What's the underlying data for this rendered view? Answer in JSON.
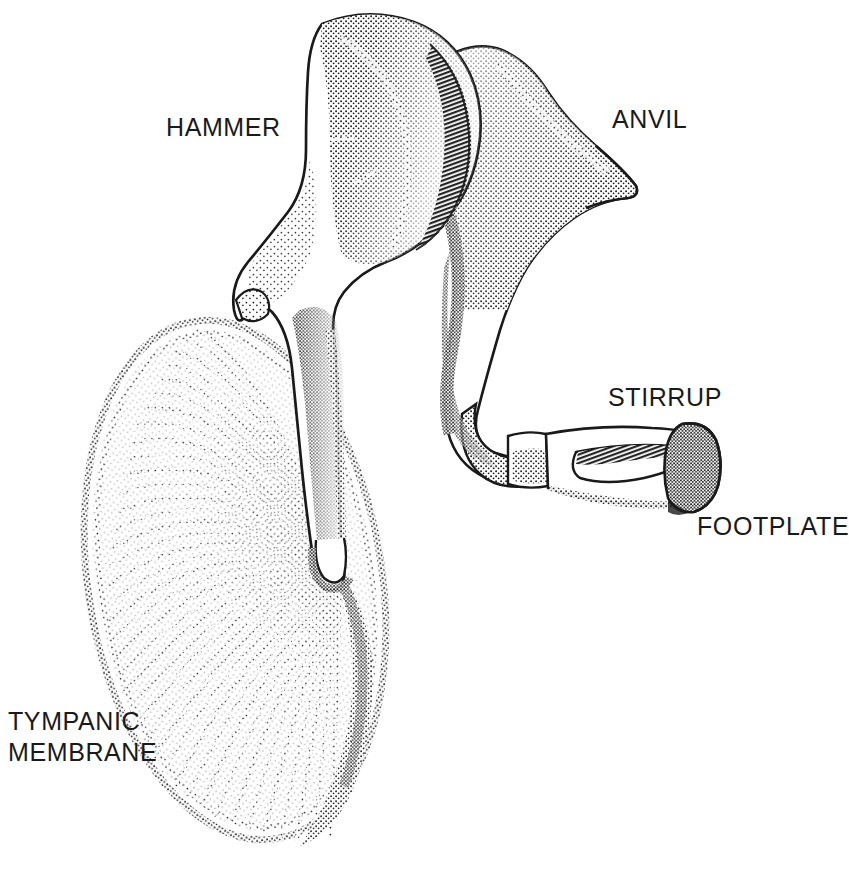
{
  "figure": {
    "style": "stipple-engraving line drawing",
    "background_color": "#ffffff",
    "ink_color": "#1a1a1a",
    "width": 839,
    "height": 877
  },
  "labels": {
    "hammer": "HAMMER",
    "anvil": "ANVIL",
    "stirrup": "STIRRUP",
    "footplate": "FOOTPLATE",
    "tympanic_membrane": "TYMPANIC\nMEMBRANE"
  },
  "structures": [
    {
      "name": "hammer",
      "anatomical_name": "malleus",
      "label": "HAMMER",
      "label_position": {
        "x": 166,
        "y": 112
      },
      "description": "Rounded head with articular facet, neck, and long manubrium descending to the umbo of the tympanic membrane."
    },
    {
      "name": "anvil",
      "anatomical_name": "incus",
      "label": "ANVIL",
      "label_position": {
        "x": 612,
        "y": 104
      },
      "description": "Body with a pointed short process projecting to the right and a long process descending and curving to meet the stirrup."
    },
    {
      "name": "stirrup",
      "anatomical_name": "stapes",
      "label": "STIRRUP",
      "label_position": {
        "x": 608,
        "y": 382
      },
      "description": "Head, anterior and posterior crura enclosing a triangular obturator foramen, attached to the footplate."
    },
    {
      "name": "footplate",
      "anatomical_name": "stapes footplate",
      "label": "FOOTPLATE",
      "label_position": {
        "x": 697,
        "y": 511
      },
      "description": "Densely stippled oval plate at the right end of the stirrup."
    },
    {
      "name": "tympanic-membrane",
      "anatomical_name": "tympanic membrane",
      "label": "TYMPANIC MEMBRANE",
      "label_position": {
        "x": 8,
        "y": 706
      },
      "description": "Large oval membrane with radial stippled fibres converging on the umbo at the tip of the hammer handle."
    }
  ]
}
